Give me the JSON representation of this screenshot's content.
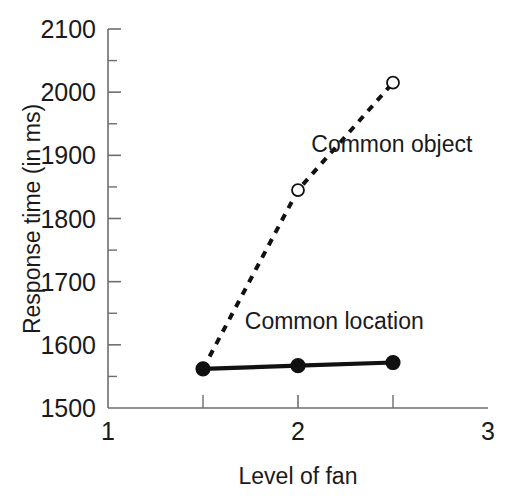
{
  "chart_data": {
    "type": "line",
    "title": "",
    "xlabel": "Level of fan",
    "ylabel": "Response time (in ms)",
    "xlim": [
      1,
      3
    ],
    "ylim": [
      1500,
      2100
    ],
    "x": [
      1.5,
      2,
      2.5
    ],
    "grid": false,
    "legend_position": "inline-annotation",
    "series": [
      {
        "name": "Common object",
        "values": [
          1562,
          1845,
          2015
        ],
        "line_style": "dashed",
        "marker": "open-circle",
        "color": "#111111"
      },
      {
        "name": "Common location",
        "values": [
          1562,
          1567,
          1572
        ],
        "line_style": "solid",
        "marker": "filled-circle",
        "color": "#111111"
      }
    ],
    "y_ticks_major": [
      1500,
      1600,
      1700,
      1800,
      1900,
      2000,
      2100
    ],
    "y_tick_labels": [
      "1500",
      "1600",
      "1700",
      "1800",
      "1900",
      "2000",
      "2100"
    ],
    "y_ticks_minor": [
      1550,
      1650,
      1750,
      1850,
      1950,
      2050
    ],
    "x_ticks_major": [
      1,
      2,
      3
    ],
    "x_tick_labels": [
      "1",
      "2",
      "3"
    ],
    "x_ticks_minor": [
      1.5,
      2.5
    ],
    "annotations": [
      {
        "text": "Common object",
        "x": 2.07,
        "y": 1905
      },
      {
        "text": "Common location",
        "x": 1.72,
        "y": 1625
      }
    ]
  },
  "colors": {
    "axis": "#6e6e6e",
    "ink": "#111111",
    "background": "#ffffff"
  }
}
